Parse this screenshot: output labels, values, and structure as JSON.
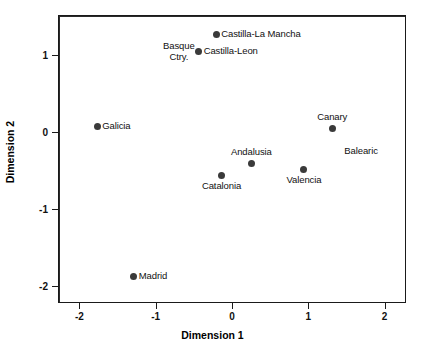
{
  "chart_data": {
    "type": "scatter",
    "title": "",
    "xlabel": "Dimension 1",
    "ylabel": "Dimension 2",
    "xlim": [
      -2.28,
      2.28
    ],
    "ylim": [
      -2.22,
      1.52
    ],
    "xticks": [
      -2,
      -1,
      0,
      1,
      2
    ],
    "xticklabels": [
      "-2",
      "-1",
      "0",
      "1",
      "2"
    ],
    "yticks": [
      1,
      0,
      -1,
      -2
    ],
    "yticklabels": [
      "1",
      "0",
      "-1",
      "-2"
    ],
    "grid": false,
    "legend": null,
    "zero_lines": {
      "horizontal": 0,
      "vertical": 0
    },
    "marker_color": "#3a3a3a",
    "axis_color": "#1a1a1a",
    "points": [
      {
        "label": "Castilla-La Mancha",
        "x": -0.22,
        "y": 1.28,
        "label_pos": "right"
      },
      {
        "label": "Castilla-Leon",
        "x": -0.45,
        "y": 1.06,
        "label_pos": "right"
      },
      {
        "label": "Basque\nCtry.",
        "x": -0.45,
        "y": 1.06,
        "label_pos": "left"
      },
      {
        "label": "Galicia",
        "x": -1.78,
        "y": 0.09,
        "label_pos": "right"
      },
      {
        "label": "Canary",
        "x": 1.3,
        "y": 0.06,
        "label_pos": "above"
      },
      {
        "label": "Balearic",
        "x": 1.95,
        "y": -0.23,
        "label_pos": "left"
      },
      {
        "label": "Andalusia",
        "x": 0.24,
        "y": -0.39,
        "label_pos": "above"
      },
      {
        "label": "Valencia",
        "x": 0.93,
        "y": -0.47,
        "label_pos": "below"
      },
      {
        "label": "Catalonia",
        "x": -0.15,
        "y": -0.55,
        "label_pos": "below"
      },
      {
        "label": "Madrid",
        "x": -1.3,
        "y": -1.86,
        "label_pos": "right"
      }
    ]
  }
}
